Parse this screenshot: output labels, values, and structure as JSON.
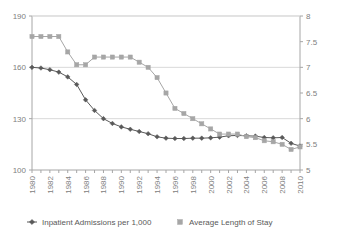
{
  "chart_data": {
    "type": "line",
    "title": "",
    "xlabel": "",
    "ylabel": "",
    "grid": true,
    "legend_position": "bottom",
    "x": [
      1980,
      1981,
      1982,
      1983,
      1984,
      1985,
      1986,
      1987,
      1988,
      1989,
      1990,
      1991,
      1992,
      1993,
      1994,
      1995,
      1996,
      1997,
      1998,
      1999,
      2000,
      2001,
      2002,
      2003,
      2004,
      2005,
      2006,
      2007,
      2008,
      2009,
      2010
    ],
    "x_tick_labels": [
      "1980",
      "1982",
      "1984",
      "1986",
      "1988",
      "1990",
      "1992",
      "1994",
      "1996",
      "1998",
      "2000",
      "2002",
      "2004",
      "2006",
      "2008",
      "2010"
    ],
    "x_tick_values": [
      1980,
      1982,
      1984,
      1986,
      1988,
      1990,
      1992,
      1994,
      1996,
      1998,
      2000,
      2002,
      2004,
      2006,
      2008,
      2010
    ],
    "axes": [
      {
        "id": "left",
        "name": "Inpatient Admissions per 1,000",
        "ticks": [
          100,
          130,
          160,
          190
        ],
        "tick_labels": [
          "100",
          "130",
          "160",
          "190"
        ],
        "ylim": [
          100,
          190
        ]
      },
      {
        "id": "right",
        "name": "Average Length of Stay",
        "ticks": [
          5,
          5.5,
          6,
          6.5,
          7,
          7.5,
          8
        ],
        "tick_labels": [
          "5",
          "5.5",
          "6",
          "6.5",
          "7",
          "7.5",
          "8"
        ],
        "ylim": [
          5,
          8
        ]
      }
    ],
    "series": [
      {
        "name": "Inpatient Admissions per 1,000",
        "axis": "left",
        "color": "#595959",
        "marker": "diamond",
        "values": [
          160.0,
          159.6,
          158.6,
          157.2,
          154.4,
          150.0,
          141.0,
          134.8,
          130.0,
          127.2,
          125.2,
          123.8,
          122.5,
          121.2,
          119.4,
          118.6,
          118.4,
          118.4,
          118.6,
          118.6,
          118.8,
          119.2,
          120.0,
          120.2,
          120.0,
          119.8,
          119.0,
          118.8,
          119.0,
          115.6,
          114.0
        ]
      },
      {
        "name": "Average Length of Stay",
        "axis": "right",
        "color": "#a6a6a6",
        "marker": "square",
        "values": [
          7.6,
          7.6,
          7.6,
          7.6,
          7.3,
          7.05,
          7.05,
          7.2,
          7.2,
          7.2,
          7.2,
          7.2,
          7.1,
          7.0,
          6.8,
          6.5,
          6.2,
          6.1,
          6.0,
          5.9,
          5.8,
          5.7,
          5.7,
          5.7,
          5.65,
          5.63,
          5.57,
          5.55,
          5.5,
          5.4,
          5.45
        ]
      }
    ],
    "legend": [
      {
        "label": "Inpatient Admissions per 1,000",
        "color": "#595959",
        "marker": "diamond-line"
      },
      {
        "label": "Average Length of Stay",
        "color": "#a6a6a6",
        "marker": "square"
      }
    ],
    "colors": {
      "admissions": "#595959",
      "length_of_stay": "#a6a6a6",
      "axis": "#a6a6a6",
      "grid": "#d9d9d9",
      "text": "#808080",
      "background": "#ffffff"
    }
  }
}
